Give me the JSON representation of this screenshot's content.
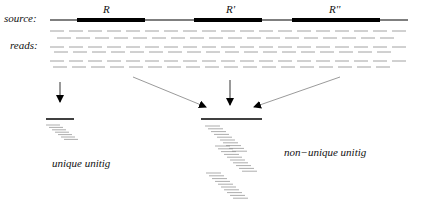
{
  "labels": {
    "source": "source:",
    "reads": "reads:",
    "repeat_1": "R",
    "repeat_2": "R'",
    "repeat_3": "R''",
    "unique_unitig": "unique unitig",
    "non_unique_unitig": "non−unique unitig"
  },
  "colors": {
    "line": "#000000",
    "reads": "#8a8a8a",
    "arrow": "#555555"
  },
  "source": {
    "y": 20,
    "x_start": 50,
    "x_end": 408,
    "repeats": [
      {
        "label_key": "repeat_1",
        "x1": 77,
        "x2": 145
      },
      {
        "label_key": "repeat_2",
        "x1": 194,
        "x2": 262
      },
      {
        "label_key": "repeat_3",
        "x1": 292,
        "x2": 380
      }
    ]
  },
  "reads_rows": [
    {
      "y": 31,
      "offset": 50,
      "seg": 14,
      "gap": 5
    },
    {
      "y": 38,
      "offset": 57,
      "seg": 14,
      "gap": 5
    },
    {
      "y": 47,
      "offset": 50,
      "seg": 14,
      "gap": 5
    },
    {
      "y": 52,
      "offset": 54,
      "seg": 14,
      "gap": 5
    },
    {
      "y": 61,
      "offset": 50,
      "seg": 14,
      "gap": 5
    },
    {
      "y": 67,
      "offset": 53,
      "seg": 14,
      "gap": 5
    }
  ],
  "unique_unitig": {
    "x1": 46,
    "x2": 74,
    "y": 119,
    "stack_count": 7
  },
  "non_unique_unitig": {
    "x1": 201,
    "x2": 262,
    "y": 119,
    "stack_count": 30
  }
}
